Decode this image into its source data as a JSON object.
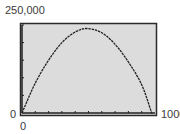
{
  "chart_data": {
    "type": "line",
    "title": "",
    "xlabel": "",
    "ylabel": "",
    "xlim": [
      0,
      1000
    ],
    "ylim": [
      0,
      250000
    ],
    "x_tick_count": 10,
    "y_tick_count": 5,
    "grid": false,
    "labels": {
      "y_max": "250,000",
      "y_min": "0",
      "x_min": "0",
      "x_max": "1000"
    },
    "series": [
      {
        "name": "curve",
        "x": [
          0,
          100,
          200,
          300,
          400,
          490,
          600,
          700,
          800,
          900,
          975
        ],
        "y": [
          0,
          85000,
          150000,
          200000,
          230000,
          240000,
          228000,
          195000,
          145000,
          80000,
          0
        ]
      }
    ],
    "colors": {
      "plot_bg": "#dcdcdc",
      "frame": "#2a2a2a",
      "curve": "#222222"
    }
  }
}
